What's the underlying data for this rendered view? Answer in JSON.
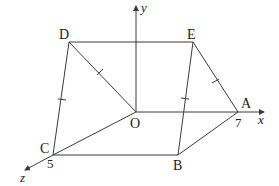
{
  "figure": {
    "axes": {
      "x": {
        "label": "x"
      },
      "y": {
        "label": "y"
      },
      "z": {
        "label": "z"
      }
    },
    "points": {
      "O": {
        "label": "O"
      },
      "A": {
        "label": "A",
        "value_label": "7"
      },
      "B": {
        "label": "B"
      },
      "C": {
        "label": "C",
        "value_label": "5"
      },
      "D": {
        "label": "D"
      },
      "E": {
        "label": "E"
      }
    },
    "edges": [
      "D-E",
      "D-O",
      "D-C",
      "E-B",
      "E-A",
      "O-A",
      "O-C",
      "C-B",
      "B-A"
    ],
    "equal_length_marks": [
      "D-O",
      "D-C",
      "E-B",
      "E-A"
    ],
    "colors": {
      "line": "#3a3a3a",
      "text": "#222222",
      "background": "#ffffff"
    }
  }
}
